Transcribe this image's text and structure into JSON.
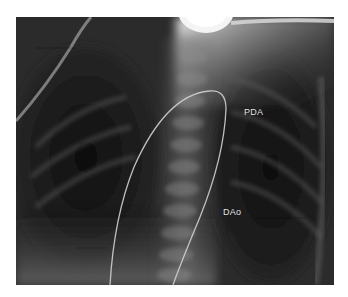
{
  "figure": {
    "type": "radiograph",
    "view": "chest x-ray with catheter",
    "annotations": [
      {
        "id": "pda",
        "text": "PDA"
      },
      {
        "id": "dao",
        "text": "DAo"
      }
    ],
    "colors": {
      "background": "#ffffff",
      "film_dark": "#1e1e1e",
      "label_text": "#e6e6e6",
      "catheter": "#d0d0d0"
    }
  }
}
